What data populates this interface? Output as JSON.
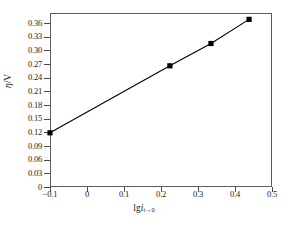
{
  "chart_data": {
    "type": "line",
    "title": "",
    "subtitle": "",
    "xlabel": "lgi_{t→0}",
    "ylabel": "η/V",
    "xlim": [
      -0.1,
      0.5
    ],
    "ylim": [
      0,
      0.375
    ],
    "grid": false,
    "legend": null,
    "xticks": [
      "−0.1",
      "0",
      "0.1",
      "0.2",
      "0.3",
      "0.4",
      "0.5"
    ],
    "xtick_values": [
      -0.1,
      0,
      0.1,
      0.2,
      0.3,
      0.4,
      0.5
    ],
    "yticks": [
      "0",
      "0.03",
      "0.06",
      "0.09",
      "0.12",
      "0.15",
      "0.18",
      "0.21",
      "0.24",
      "0.27",
      "0.30",
      "0.33",
      "0.36"
    ],
    "ytick_values": [
      0,
      0.03,
      0.06,
      0.09,
      0.12,
      0.15,
      0.18,
      0.21,
      0.24,
      0.27,
      0.3,
      0.33,
      0.36
    ],
    "series": [
      {
        "name": "Tafel line",
        "marker": "filled-square",
        "marker_color": "#000000",
        "line_color": "#000000",
        "x": [
          -0.1,
          0.224,
          0.335,
          0.438
        ],
        "y": [
          0.119,
          0.266,
          0.315,
          0.368
        ]
      }
    ]
  },
  "axis_label_parts": {
    "y_symbol": "η",
    "y_unit": "/V",
    "x_prefix": "lg",
    "x_symbol": "i",
    "x_sub_var": "t",
    "x_sub_arrow": "→0"
  },
  "colors": {
    "frame": "#5d5d5d",
    "tick": "#4a4a4a",
    "data": "#000000",
    "background": "#ffffff",
    "text": "#1a1a1a"
  }
}
